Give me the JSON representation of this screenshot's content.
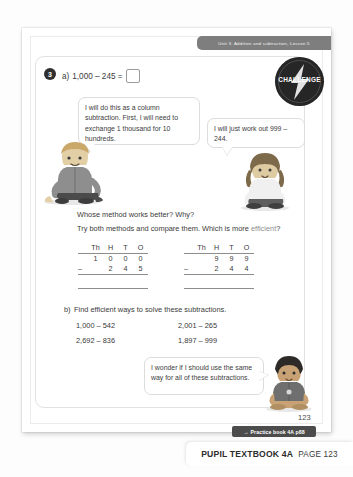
{
  "running_head": "Unit 3: Addition and subtraction, Lesson 5",
  "badge": {
    "label": "CHALLENGE",
    "icon": "lightning-bolt-icon"
  },
  "question": {
    "number": "3",
    "part_a_label": "a)",
    "expression": "1,000 – 245 =",
    "answer_value": ""
  },
  "bubbles": {
    "left": "I will do this as a column subtraction. First, I will need to exchange 1 thousand for 10 hundreds.",
    "right": "I will just work out 999 – 244.",
    "bottom": "I wonder if I should use the same way for all of these subtractions."
  },
  "prose": {
    "line1": "Whose method works better? Why?",
    "line2_before": "Try both methods and compare them. Which is more ",
    "line2_highlight": "efficient",
    "line2_after": "?"
  },
  "tables": [
    {
      "name": "column-subtraction-left",
      "headers": [
        "Th",
        "H",
        "T",
        "O"
      ],
      "minuend": [
        "1",
        "0",
        "0",
        "0"
      ],
      "operator": "–",
      "subtrahend": [
        "",
        "2",
        "4",
        "5"
      ],
      "answer": [
        "",
        "",
        "",
        ""
      ]
    },
    {
      "name": "column-subtraction-right",
      "headers": [
        "Th",
        "H",
        "T",
        "O"
      ],
      "minuend": [
        "",
        "9",
        "9",
        "9"
      ],
      "operator": "–",
      "subtrahend": [
        "",
        "2",
        "4",
        "4"
      ],
      "answer": [
        "",
        "",
        "",
        ""
      ]
    }
  ],
  "part_b": {
    "label": "b)",
    "instruction": "Find efficient ways to solve these subtractions.",
    "expressions": [
      "1,000 – 542",
      "2,692 – 836",
      "2,001 – 265",
      "1,897 – 999"
    ]
  },
  "footer": {
    "page_number": "123",
    "practice_book": "Practice book 4A p88",
    "practice_book_arrow": "→",
    "book_title": "PUPIL TEXTBOOK 4A",
    "book_page": "PAGE 123"
  },
  "colors": {
    "runhead_bg": "#7e7e7e",
    "badge_bg": "#262626",
    "practice_bg": "#4c4c4c",
    "highlight_text": "#8e8e8e"
  }
}
